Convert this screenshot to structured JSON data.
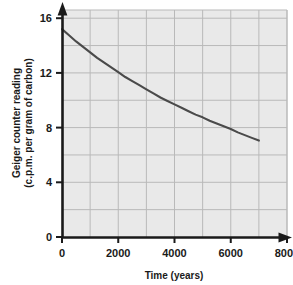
{
  "chart_data": {
    "type": "line",
    "title": "",
    "xlabel": "Time (years)",
    "ylabel_line1": "Geiger counter reading",
    "ylabel_line2": "(c.p.m. per gram of carbon)",
    "xlim": [
      0,
      8000
    ],
    "ylim": [
      0,
      16.6
    ],
    "xticks": [
      0,
      2000,
      4000,
      6000,
      8000
    ],
    "xtick_labels": [
      "0",
      "2000",
      "4000",
      "6000",
      "8000"
    ],
    "yticks": [
      0,
      4,
      8,
      12,
      16
    ],
    "ytick_labels": [
      "0",
      "4",
      "8",
      "12",
      "16"
    ],
    "x_minor_step": 1000,
    "y_minor_step": 2,
    "grid": true,
    "legend": "none",
    "series": [
      {
        "name": "carbon-14 decay",
        "x": [
          0,
          250,
          500,
          750,
          1000,
          1250,
          1500,
          1750,
          2000,
          2250,
          2500,
          2750,
          3000,
          3250,
          3500,
          3750,
          4000,
          4250,
          4500,
          4750,
          5000,
          5250,
          5500,
          5750,
          6000,
          6250,
          6500,
          6750,
          7000
        ],
        "values": [
          15.2,
          14.75,
          14.3,
          13.9,
          13.5,
          13.1,
          12.75,
          12.4,
          12.05,
          11.7,
          11.4,
          11.1,
          10.8,
          10.5,
          10.2,
          9.95,
          9.7,
          9.45,
          9.2,
          8.95,
          8.75,
          8.5,
          8.3,
          8.1,
          7.9,
          7.65,
          7.45,
          7.25,
          7.05
        ]
      }
    ],
    "colors": {
      "plot_background": "#e9e9e9",
      "gridline": "#b9b9b9",
      "axis": "#1a1a1a",
      "curve": "#4a4a4a",
      "page_background": "#ffffff"
    }
  }
}
